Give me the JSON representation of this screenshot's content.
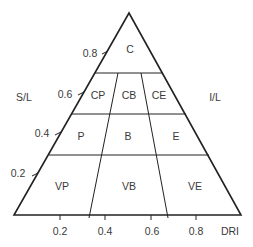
{
  "diagram": {
    "type": "ternary-classification",
    "vertices": {
      "apex": [
        129,
        13
      ],
      "bottom_left": [
        14,
        215
      ],
      "bottom_right": [
        241,
        215
      ]
    },
    "axis_labels": {
      "left": {
        "text": "S/L",
        "pos": [
          24,
          97
        ]
      },
      "right": {
        "text": "I/L",
        "pos": [
          215,
          97
        ]
      },
      "bottom": {
        "text": "DRI",
        "pos": [
          230,
          231
        ]
      }
    },
    "left_ticks": [
      {
        "label": "0.8",
        "pos": [
          90,
          53
        ]
      },
      {
        "label": "0.6",
        "pos": [
          65,
          94
        ]
      },
      {
        "label": "0.4",
        "pos": [
          42,
          133
        ]
      },
      {
        "label": "0.2",
        "pos": [
          18,
          173
        ]
      }
    ],
    "bottom_ticks": [
      {
        "label": "0.2",
        "pos": [
          60,
          231
        ]
      },
      {
        "label": "0.4",
        "pos": [
          105,
          231
        ]
      },
      {
        "label": "0.6",
        "pos": [
          152,
          231
        ]
      },
      {
        "label": "0.8",
        "pos": [
          196,
          231
        ]
      }
    ],
    "regions": [
      {
        "label": "C",
        "pos": [
          130,
          49
        ]
      },
      {
        "label": "CP",
        "pos": [
          98,
          95
        ]
      },
      {
        "label": "CB",
        "pos": [
          129,
          95
        ]
      },
      {
        "label": "CE",
        "pos": [
          159,
          95
        ]
      },
      {
        "label": "P",
        "pos": [
          81,
          136
        ]
      },
      {
        "label": "B",
        "pos": [
          128,
          136
        ]
      },
      {
        "label": "E",
        "pos": [
          176,
          136
        ]
      },
      {
        "label": "VP",
        "pos": [
          62,
          186
        ]
      },
      {
        "label": "VB",
        "pos": [
          129,
          186
        ]
      },
      {
        "label": "VE",
        "pos": [
          195,
          186
        ]
      }
    ]
  }
}
